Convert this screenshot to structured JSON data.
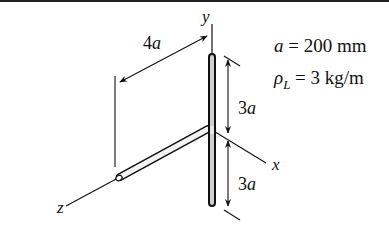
{
  "figure": {
    "axes": {
      "x_label": "x",
      "y_label": "y",
      "z_label": "z"
    },
    "dimensions": {
      "horizontal_length": "4a",
      "upper_vertical_length": "3a",
      "lower_vertical_length": "3a"
    },
    "parameters": {
      "a_symbol": "a",
      "a_value": "= 200 mm",
      "rho_symbol": "ρ",
      "rho_subscript": "L",
      "rho_value": "= 3 kg/m"
    }
  }
}
